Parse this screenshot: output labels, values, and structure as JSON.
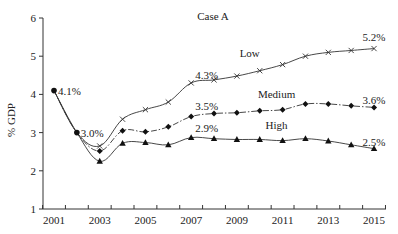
{
  "chart_data": {
    "type": "line",
    "title": "Case A",
    "xlabel": "",
    "ylabel": "% GDP",
    "x": [
      2001,
      2002,
      2003,
      2004,
      2005,
      2006,
      2007,
      2008,
      2009,
      2010,
      2011,
      2012,
      2013,
      2014,
      2015
    ],
    "x_tick_labels": [
      "2001",
      "2003",
      "2005",
      "2007",
      "2009",
      "2011",
      "2013",
      "2015"
    ],
    "y_tick_labels": [
      "1",
      "2",
      "3",
      "4",
      "5",
      "6"
    ],
    "ylim": [
      1,
      6
    ],
    "xlim": [
      2000.5,
      2015.5
    ],
    "grid": false,
    "legend": "inline labels",
    "series": [
      {
        "name": "Low",
        "marker": "x",
        "linestyle": "solid",
        "values": [
          4.1,
          3.0,
          2.65,
          3.35,
          3.6,
          3.8,
          4.3,
          4.38,
          4.48,
          4.62,
          4.78,
          5.0,
          5.1,
          5.15,
          5.2
        ],
        "label_position": {
          "x_index": 9,
          "dx": -10,
          "dy": -14
        }
      },
      {
        "name": "Medium",
        "marker": "diamond",
        "linestyle": "dashdot",
        "values": [
          4.1,
          3.0,
          2.52,
          3.05,
          3.02,
          3.15,
          3.42,
          3.5,
          3.52,
          3.57,
          3.6,
          3.75,
          3.75,
          3.7,
          3.66
        ],
        "label_position": {
          "x_index": 10,
          "dx": -6,
          "dy": -12
        }
      },
      {
        "name": "High",
        "marker": "triangle",
        "linestyle": "solid",
        "values": [
          4.1,
          3.0,
          2.25,
          2.72,
          2.74,
          2.68,
          2.87,
          2.84,
          2.82,
          2.82,
          2.79,
          2.84,
          2.78,
          2.68,
          2.58
        ],
        "label_position": {
          "x_index": 10,
          "dx": -6,
          "dy": -12
        }
      }
    ],
    "annotations": [
      {
        "text": "4.1%",
        "x": 2001,
        "y": 4.1
      },
      {
        "text": "3.0%",
        "x": 2002,
        "y": 3.0
      },
      {
        "text": "4.3%",
        "x": 2007,
        "y": 4.3,
        "series": "Low"
      },
      {
        "text": "3.5%",
        "x": 2007,
        "y": 3.5,
        "series": "Medium"
      },
      {
        "text": "2.9%",
        "x": 2007,
        "y": 2.9,
        "series": "High"
      },
      {
        "text": "5.2%",
        "x": 2015,
        "y": 5.2,
        "series": "Low"
      },
      {
        "text": "3.6%",
        "x": 2015,
        "y": 3.6,
        "series": "Medium"
      },
      {
        "text": "2.5%",
        "x": 2015,
        "y": 2.5,
        "series": "High"
      }
    ]
  },
  "colors": {
    "line": "#333333",
    "text": "#222222",
    "background": "#ffffff"
  }
}
